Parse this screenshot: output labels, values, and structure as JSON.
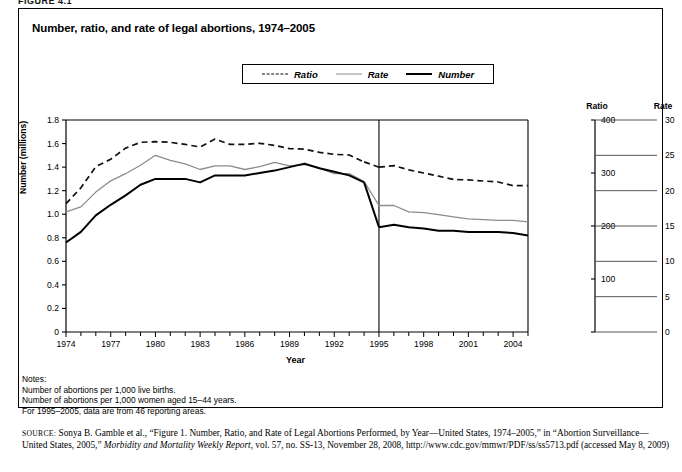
{
  "figure": {
    "label": "FIGURE 4.1",
    "title": "Number, ratio, and rate of legal abortions, 1974–2005"
  },
  "legend": {
    "items": [
      {
        "label": "Ratio",
        "style": "dashed",
        "color": "#111111"
      },
      {
        "label": "Rate",
        "style": "thin",
        "color": "#8c8c8c"
      },
      {
        "label": "Number",
        "style": "thick",
        "color": "#000000"
      }
    ]
  },
  "axes": {
    "left": {
      "title": "Number (millions)",
      "min": 0,
      "max": 1.8,
      "step": 0.2,
      "ticks": [
        "0",
        "0.2",
        "0.4",
        "0.6",
        "0.8",
        "1.0",
        "1.2",
        "1.4",
        "1.6",
        "1.8"
      ]
    },
    "ratio": {
      "title": "Ratio",
      "min": 0,
      "max": 400,
      "step": 100,
      "ticks": [
        "0",
        "100",
        "200",
        "300",
        "400"
      ]
    },
    "rate": {
      "title": "Rate",
      "min": 0,
      "max": 30,
      "step": 5,
      "ticks": [
        "0",
        "5",
        "10",
        "15",
        "20",
        "25",
        "30"
      ]
    },
    "x": {
      "title": "Year",
      "min": 1974,
      "max": 2005,
      "ticks": [
        "1974",
        "1977",
        "1980",
        "1983",
        "1986",
        "1989",
        "1992",
        "1995",
        "1998",
        "2001",
        "2004"
      ]
    }
  },
  "annotations": {
    "break_year": 1995,
    "break_note": "vertical rule marking change in reporting areas"
  },
  "notes": {
    "heading": "Notes:",
    "lines": [
      "Number of abortions per 1,000 live births.",
      "Number of abortions per 1,000 women aged 15–44 years.",
      "For 1995–2005, data are from 46 reporting areas."
    ]
  },
  "source": {
    "prefix": "SOURCE:",
    "text": " Sonya B. Gamble et al., “Figure 1. Number, Ratio, and Rate of Legal Abortions Performed, by Year—United States, 1974–2005,” in “Abortion Surveillance—United States, 2005,” ",
    "italic": "Morbidity and Mortality Weekly Report",
    "tail": ", vol. 57, no. SS-13, November 28, 2008, http://www.cdc.gov/mmwr/PDF/ss/ss5713.pdf (accessed May 8, 2009)"
  },
  "chart_data": {
    "type": "line",
    "title": "Number, ratio, and rate of legal abortions, 1974–2005",
    "xlabel": "Year",
    "ylabel": "Number (millions)",
    "ylim": [
      0,
      1.8
    ],
    "xlim": [
      1974,
      2005
    ],
    "grid": false,
    "legend_position": "top-center",
    "x": [
      1974,
      1975,
      1976,
      1977,
      1978,
      1979,
      1980,
      1981,
      1982,
      1983,
      1984,
      1985,
      1986,
      1987,
      1988,
      1989,
      1990,
      1991,
      1992,
      1993,
      1994,
      1995,
      1996,
      1997,
      1998,
      1999,
      2000,
      2001,
      2002,
      2003,
      2004,
      2005
    ],
    "series": [
      {
        "name": "Ratio",
        "axis": "ratio",
        "unit": "abortions per 1,000 live births",
        "style": "dashed",
        "values": [
          242,
          272,
          312,
          326,
          347,
          358,
          359,
          358,
          354,
          349,
          364,
          354,
          354,
          356,
          352,
          346,
          345,
          339,
          335,
          334,
          321,
          311,
          314,
          306,
          300,
          294,
          288,
          287,
          285,
          283,
          276,
          276
        ]
      },
      {
        "name": "Rate",
        "axis": "rate",
        "unit": "abortions per 1,000 women aged 15–44",
        "style": "thin",
        "values": [
          17.0,
          17.7,
          19.8,
          21.4,
          22.4,
          23.6,
          25.0,
          24.3,
          23.8,
          23.0,
          23.5,
          23.5,
          23.0,
          23.4,
          24.0,
          23.5,
          23.7,
          23.2,
          22.4,
          22.4,
          21.3,
          17.9,
          17.9,
          17.0,
          16.9,
          16.6,
          16.3,
          16.0,
          15.9,
          15.8,
          15.8,
          15.6
        ]
      },
      {
        "name": "Number",
        "axis": "left",
        "unit": "millions of abortions",
        "style": "thick",
        "values": [
          0.76,
          0.85,
          0.99,
          1.08,
          1.16,
          1.25,
          1.3,
          1.3,
          1.3,
          1.27,
          1.33,
          1.33,
          1.33,
          1.35,
          1.37,
          1.4,
          1.43,
          1.39,
          1.36,
          1.33,
          1.27,
          0.89,
          0.91,
          0.89,
          0.88,
          0.86,
          0.86,
          0.85,
          0.85,
          0.85,
          0.84,
          0.82
        ]
      }
    ]
  }
}
